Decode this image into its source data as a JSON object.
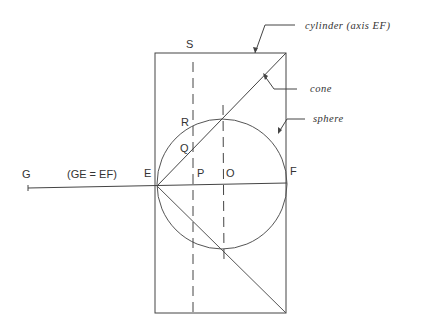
{
  "diagram": {
    "labels": {
      "S": "S",
      "R": "R",
      "Q": "Q",
      "P": "P",
      "O": "O",
      "E": "E",
      "F": "F",
      "G": "G",
      "ge_ef": "(GE = EF)"
    },
    "callouts": {
      "cylinder": "cylinder (axis EF)",
      "cone": "cone",
      "sphere": "sphere"
    },
    "colors": {
      "line": "#444444",
      "text": "#333333",
      "background": "#ffffff"
    }
  }
}
